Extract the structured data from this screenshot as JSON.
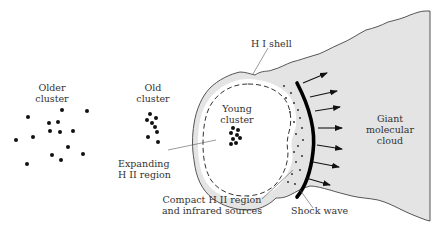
{
  "diagram": {
    "type": "star-formation-sequence",
    "colors": {
      "cloud_fill": "#e4e4e4",
      "outline": "#444444",
      "dots": "#111111",
      "text": "#333333",
      "shock_wave": "#000000"
    }
  },
  "labels": {
    "older_cluster": [
      "Older",
      "cluster"
    ],
    "old_cluster": [
      "Old",
      "cluster"
    ],
    "young_cluster": [
      "Young",
      "cluster"
    ],
    "hi_shell": "H I shell",
    "expanding_hii": [
      "Expanding",
      "H II region"
    ],
    "compact_hii": [
      "Compact H II region",
      "and infrared sources"
    ],
    "shock_wave": "Shock wave",
    "giant_cloud": [
      "Giant",
      "molecular",
      "cloud"
    ]
  },
  "clusters": {
    "older": [
      [
        28,
        117
      ],
      [
        62,
        110
      ],
      [
        87,
        111
      ],
      [
        49,
        123
      ],
      [
        58,
        122
      ],
      [
        16,
        140
      ],
      [
        33,
        137
      ],
      [
        50,
        131
      ],
      [
        60,
        132
      ],
      [
        73,
        131
      ],
      [
        68,
        147
      ],
      [
        52,
        155
      ],
      [
        61,
        160
      ],
      [
        83,
        154
      ],
      [
        27,
        164
      ]
    ],
    "old": [
      [
        150,
        114
      ],
      [
        147,
        120
      ],
      [
        152,
        123
      ],
      [
        156,
        118
      ],
      [
        155,
        127
      ],
      [
        157,
        132
      ],
      [
        148,
        137
      ],
      [
        158,
        142
      ]
    ],
    "young": [
      [
        233,
        128
      ],
      [
        238,
        130
      ],
      [
        231,
        133
      ],
      [
        237,
        135
      ],
      [
        240,
        138
      ],
      [
        233,
        139
      ],
      [
        236,
        143
      ],
      [
        231,
        144
      ]
    ]
  }
}
